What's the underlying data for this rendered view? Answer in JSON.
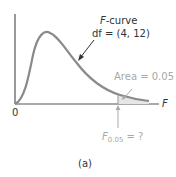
{
  "figure": {
    "curve_label_prefix": "F",
    "curve_label_suffix": "-curve",
    "df_label": "df = (4, 12)",
    "area_label": "Area = 0.05",
    "critical_label_F": "F",
    "critical_label_sub": "0.05",
    "critical_label_suffix": " = ?",
    "origin_label": "0",
    "x_axis_label": "F",
    "caption": "(a)",
    "colors": {
      "curve": "#8a8a8a",
      "axis": "#444444",
      "annotation": "#a8a8a8"
    }
  }
}
